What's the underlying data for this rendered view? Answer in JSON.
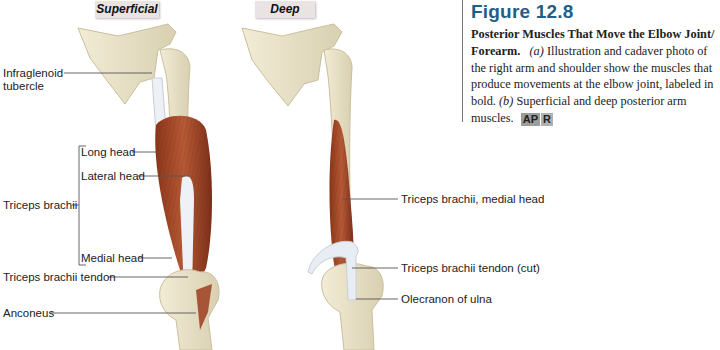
{
  "panels": {
    "superficial": "Superficial",
    "deep": "Deep"
  },
  "labels_left": {
    "infraglenoid": [
      "Infraglenoid",
      "tubercle"
    ],
    "long_head": "Long head",
    "lateral_head": "Lateral head",
    "triceps_brachii": "Triceps brachii",
    "medial_head": "Medial head",
    "triceps_tendon": "Triceps brachii tendon",
    "anconeus": "Anconeus"
  },
  "labels_right": {
    "medial_head": "Triceps brachii, medial head",
    "tendon_cut": "Triceps brachii tendon (cut)",
    "olecranon": "Olecranon of ulna"
  },
  "caption": {
    "figure_number": "Figure 12.8",
    "title": "Posterior Muscles That Move the Elbow Joint/ Forearm.",
    "part_a_letter": "(a)",
    "part_a_text": "Illustration and cadaver photo of the right arm and shoulder show the muscles that produce movements at the elbow joint, labeled in bold.",
    "part_b_letter": "(b)",
    "part_b_text": "Superficial and deep posterior arm muscles.",
    "badge_ap": "AP",
    "badge_r": "R"
  },
  "colors": {
    "bone": "#ebe4cc",
    "bone_shade": "#cfc6a6",
    "muscle": "#a8482a",
    "muscle_dark": "#7e2f1a",
    "tendon": "#e9eef4",
    "caption_title": "#1f5f86",
    "leader_line": "#555555"
  }
}
